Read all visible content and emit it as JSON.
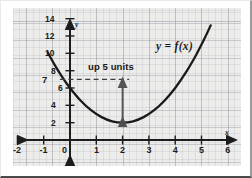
{
  "chart_data": {
    "type": "line",
    "title": "",
    "xlabel": "x",
    "ylabel": "y",
    "xlim": [
      -2.35,
      6.35
    ],
    "ylim": [
      -1.0,
      15.2
    ],
    "grid": true,
    "legend": "none",
    "function_expression": "f(x) = (x - 2)^2 + 2",
    "vertex": {
      "x": 2,
      "y": 2,
      "marker": "star"
    },
    "x_ticks": [
      -2,
      -1,
      0,
      1,
      2,
      3,
      4,
      5,
      6
    ],
    "x_tick_labels": [
      "-2",
      "-1",
      "0",
      "1",
      "2",
      "3",
      "4",
      "5",
      "6"
    ],
    "y_ticks": [
      2,
      4,
      6,
      8,
      10,
      12,
      14
    ],
    "y_tick_labels": [
      "2",
      "4",
      "6",
      "8",
      "10",
      "12",
      "14"
    ],
    "extra_y_label": {
      "value": 7,
      "text": "7"
    },
    "series": [
      {
        "name": "y = f(x)",
        "color": "#1a1a1a",
        "x": [
          -0.85,
          -0.6,
          -0.3,
          0,
          0.4,
          0.8,
          1.2,
          1.6,
          2,
          2.4,
          2.8,
          3.2,
          3.6,
          4,
          4.4,
          4.8,
          5.1,
          5.35
        ],
        "y": [
          10.12,
          8.76,
          7.29,
          6.0,
          4.56,
          3.44,
          2.64,
          2.16,
          2.0,
          2.16,
          2.64,
          3.44,
          4.56,
          6.0,
          7.76,
          9.84,
          11.61,
          13.22
        ]
      }
    ],
    "annotations": [
      {
        "name": "shift-arrow",
        "text": "up 5 units",
        "from": {
          "x": 2,
          "y": 2
        },
        "to": {
          "x": 2,
          "y": 7
        },
        "style": "double-headed-arrow"
      },
      {
        "name": "reference-dashed-line",
        "text": "",
        "from": {
          "x": 0,
          "y": 7
        },
        "to": {
          "x": 2.25,
          "y": 7
        },
        "style": "dashed"
      },
      {
        "name": "function-label",
        "text": "y = f(x)",
        "x": 4.05,
        "y": 11.7
      }
    ]
  },
  "labels": {
    "function_label": "y = f(x)",
    "shift_label": "up 5 units",
    "x_axis_name": "x",
    "y_axis_name": "y"
  },
  "colors": {
    "curve": "#1a1a1a",
    "axis": "#1c1c1c",
    "plot_background": "#ececeb",
    "grid": "#9898a4",
    "annotation": "#4a4a4a",
    "page_background": "#ffffff"
  }
}
